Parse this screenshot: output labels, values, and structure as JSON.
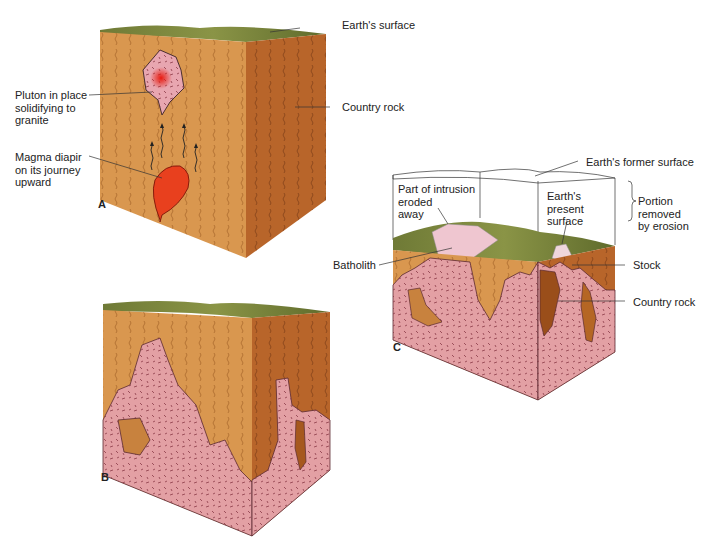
{
  "figure": {
    "panels": [
      {
        "id": "A",
        "letter": "A",
        "labels": {
          "earths_surface": "Earth's surface",
          "country_rock": "Country rock",
          "pluton": "Pluton in place\nsolidifying to\ngranite",
          "magma_diapir": "Magma diapir\non its journey\nupward"
        }
      },
      {
        "id": "B",
        "letter": "B",
        "labels": {}
      },
      {
        "id": "C",
        "letter": "C",
        "labels": {
          "former_surface": "Earth's former surface",
          "eroded": "Part of intrusion\neroded\naway",
          "present_surface": "Earth's\npresent\nsurface",
          "portion_removed": "Portion\nremoved\nby erosion",
          "batholith": "Batholith",
          "stock": "Stock",
          "country_rock": "Country rock"
        }
      }
    ],
    "colors": {
      "country_rock_front": "#d9974f",
      "country_rock_side": "#b8652a",
      "granite": "#e3a0a4",
      "granite_line": "#7a3a40",
      "magma": "#e8401e",
      "surface": "#7a8a3a",
      "leader": "#333333"
    }
  }
}
